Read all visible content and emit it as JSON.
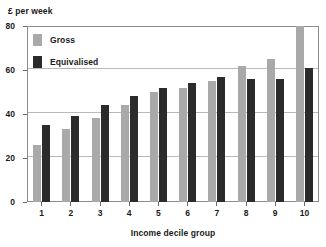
{
  "chart_data": {
    "type": "bar",
    "title": "",
    "subtitle": "",
    "xlabel": "Income decile group",
    "ylabel": "£ per week",
    "categories": [
      "1",
      "2",
      "3",
      "4",
      "5",
      "6",
      "7",
      "8",
      "9",
      "10"
    ],
    "series": [
      {
        "name": "Gross",
        "color": "#a9a9a9",
        "values": [
          26,
          33,
          38,
          44,
          50,
          52,
          55,
          62,
          65,
          80
        ]
      },
      {
        "name": "Equivalised",
        "color": "#2b2b2b",
        "values": [
          35,
          39,
          44,
          48,
          52,
          54,
          57,
          56,
          56,
          61
        ]
      }
    ],
    "ylim": [
      0,
      80
    ],
    "yticks": [
      0,
      20,
      40,
      60,
      80
    ],
    "ytick_labels": [
      "0",
      "20",
      "40",
      "60",
      "80"
    ],
    "grid": true,
    "grid_axis": "y",
    "legend_position": "top-left",
    "annotations": []
  },
  "legend": {
    "items": [
      {
        "label": "Gross"
      },
      {
        "label": "Equivalised"
      }
    ]
  },
  "colors": {
    "gross": "#a9a9a9",
    "equivalised": "#2b2b2b",
    "gridline": "#b9b9b9",
    "frame": "#8c8c8c",
    "text": "#1a1a1a",
    "background": "#ffffff"
  }
}
